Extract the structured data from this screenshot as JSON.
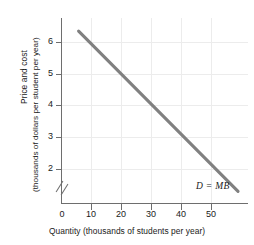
{
  "chart_data": {
    "type": "line",
    "title": "",
    "xlabel": "Quantity (thousands of students per year)",
    "ylabel_line1": "Price and cost",
    "ylabel_line2": "(thousands of dollars per student per year)",
    "xlim": [
      0,
      56
    ],
    "ylim": [
      1.4,
      7.0
    ],
    "y_axis_break": true,
    "y_axis_break_note": "axis broken between 0 and 2",
    "grid": true,
    "legend_position": "inline-annotation",
    "xticks": [
      0,
      10,
      20,
      30,
      40,
      50
    ],
    "xtick_labels": [
      "0",
      "10",
      "20",
      "30",
      "40",
      "50"
    ],
    "yticks": [
      2,
      3,
      4,
      5,
      6
    ],
    "ytick_labels": [
      "2",
      "3",
      "4",
      "5",
      "6"
    ],
    "series": [
      {
        "name": "D = MB",
        "annotation": "D = MB",
        "color": "#808080",
        "x": [
          5,
          53
        ],
        "y": [
          6.6,
          1.75
        ],
        "points": [
          {
            "x": 5,
            "y": 6.6
          },
          {
            "x": 10,
            "y": 6.1
          },
          {
            "x": 20,
            "y": 5.1
          },
          {
            "x": 30,
            "y": 4.1
          },
          {
            "x": 40,
            "y": 3.1
          },
          {
            "x": 50,
            "y": 2.05
          },
          {
            "x": 53,
            "y": 1.75
          }
        ]
      }
    ]
  },
  "colors": {
    "curve": "#808080",
    "axis": "#6e6e6e",
    "grid": "#ececec",
    "text": "#1a1a1a",
    "background": "#ffffff"
  }
}
